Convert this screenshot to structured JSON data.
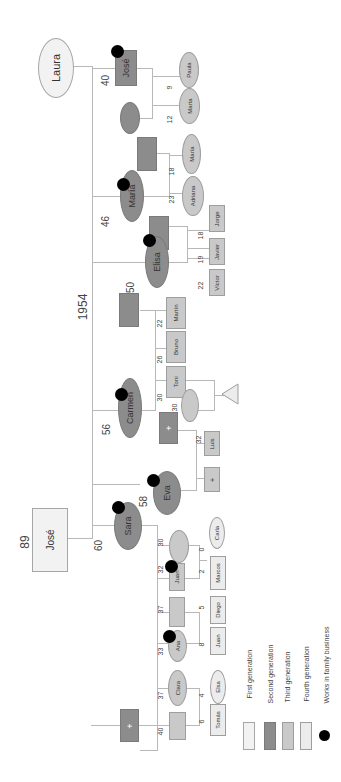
{
  "diagram": {
    "type": "genogram",
    "orientation": "rotated 90 degrees",
    "marriage_year": "1954",
    "first_generation": [
      {
        "name": "José",
        "age": "89",
        "shape": "square"
      },
      {
        "name": "Laura",
        "shape": "circle"
      }
    ],
    "second_generation": [
      {
        "name": "José",
        "age": "40",
        "works_in_business": true,
        "shape": "square"
      },
      {
        "name": "María",
        "age": "46",
        "works_in_business": true,
        "shape": "circle"
      },
      {
        "name": "Elisa",
        "age": "50",
        "works_in_business": true,
        "shape": "circle"
      },
      {
        "name": "Carmen",
        "age": "56",
        "works_in_business": true,
        "shape": "circle"
      },
      {
        "name": "Eva",
        "age": "58",
        "works_in_business": true,
        "shape": "circle"
      },
      {
        "name": "Sara",
        "age": "60",
        "works_in_business": true,
        "shape": "circle"
      }
    ],
    "third_generation": [
      {
        "name": "Paula",
        "age": "9"
      },
      {
        "name": "Marta",
        "age": "12"
      },
      {
        "name": "María",
        "age": "18"
      },
      {
        "name": "Adriana",
        "age": "23"
      },
      {
        "name": "Jorge",
        "age": "18"
      },
      {
        "name": "Javier",
        "age": "19"
      },
      {
        "name": "Víctor",
        "age": "22"
      },
      {
        "name": "Martín",
        "age": "22"
      },
      {
        "name": "Bruno",
        "age": "26"
      },
      {
        "name": "Toni",
        "age": "30"
      },
      {
        "name": "Luis",
        "age": "32"
      },
      {
        "name": "Juan",
        "age": "32",
        "works_in_business": true
      },
      {
        "name": "Ana",
        "age": "33",
        "works_in_business": true
      },
      {
        "name": "Clara",
        "age": "37"
      }
    ],
    "fourth_generation": [
      {
        "name": "Carla",
        "age": "0"
      },
      {
        "name": "Marcos",
        "age": "2"
      },
      {
        "name": "Diego",
        "age": "5"
      },
      {
        "name": "Juan",
        "age": "8"
      },
      {
        "name": "Elsa",
        "age": "4"
      },
      {
        "name": "Tomás",
        "age": "6"
      }
    ],
    "other_ages": {
      "toni_spouse": "30",
      "juan_spouse": "30",
      "diego_parent": "37",
      "tomas_parent": "40"
    }
  },
  "labels": {
    "jose_sr": "José",
    "jose_sr_age": "89",
    "laura": "Laura",
    "year": "1954",
    "jose_jr": "José",
    "jose_jr_age": "40",
    "maria": "María",
    "maria_age": "46",
    "elisa": "Elisa",
    "elisa_age": "50",
    "carmen": "Carmen",
    "carmen_age": "56",
    "eva": "Eva",
    "eva_age": "58",
    "sara": "Sara",
    "sara_age": "60",
    "paula": "Paula",
    "paula_age": "9",
    "marta": "Marta",
    "marta_age": "12",
    "maria2": "María",
    "maria2_age": "18",
    "adriana": "Adriana",
    "adriana_age": "23",
    "jorge": "Jorge",
    "jorge_age": "18",
    "javier": "Javier",
    "javier_age": "19",
    "victor": "Víctor",
    "victor_age": "22",
    "martin": "Martín",
    "martin_age": "22",
    "bruno": "Bruno",
    "bruno_age": "26",
    "toni": "Toni",
    "toni_age": "30",
    "toni_spouse_age": "30",
    "luis": "Luis",
    "luis_age": "32",
    "juan": "Juan",
    "juan_age": "32",
    "juan_spouse_age": "30",
    "carla": "Carla",
    "carla_age": "0",
    "marcos": "Marcos",
    "marcos_age": "2",
    "diego_parent_age": "37",
    "diego": "Diego",
    "diego_age": "5",
    "ana": "Ana",
    "ana_age": "33",
    "juan2": "Juan",
    "juan2_age": "8",
    "clara": "Clara",
    "clara_age": "37",
    "elsa": "Elsa",
    "elsa_age": "4",
    "tomas": "Tomás",
    "tomas_age": "6",
    "tomas_parent_age": "40",
    "plus": "+"
  },
  "legend": {
    "items": [
      {
        "label": "First generation",
        "color": "#f2f2f2"
      },
      {
        "label": "Second generation",
        "color": "#8c8c8c"
      },
      {
        "label": "Third generation",
        "color": "#c9c9c9"
      },
      {
        "label": "Fourth generation",
        "color": "#ececec"
      },
      {
        "label": "Works in family business",
        "color": "#000000"
      }
    ]
  }
}
